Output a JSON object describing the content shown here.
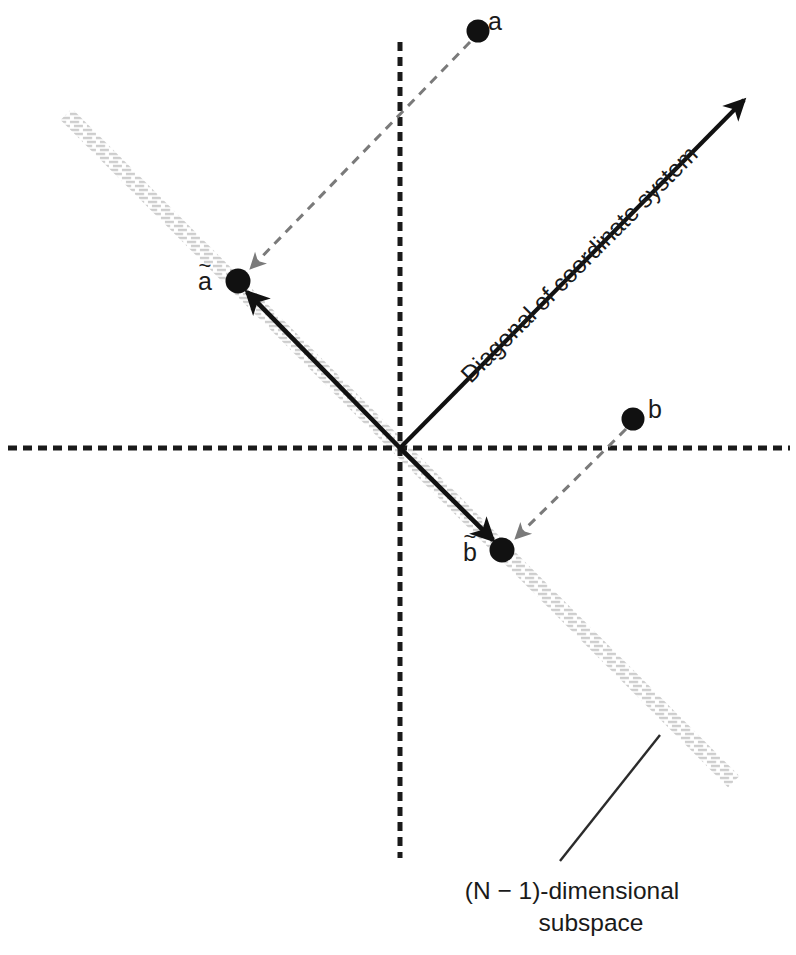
{
  "figure": {
    "width": 796,
    "height": 955,
    "background": "#ffffff",
    "origin": {
      "x": 400,
      "y": 448
    }
  },
  "colors": {
    "axis": "#1a1a1a",
    "point": "#111111",
    "vector": "#111111",
    "projection": "#7a7a7a",
    "subspace_hatch": "#b8b8b8",
    "text": "#1a1a1a",
    "leader": "#2b2b2b"
  },
  "axes": {
    "horizontal": {
      "name": "horizontal-axis",
      "x1": 8,
      "y1": 448,
      "x2": 790,
      "y2": 448,
      "style": "dashed",
      "dash": "9 6",
      "width": 5
    },
    "vertical": {
      "name": "vertical-axis",
      "x1": 400,
      "y1": 42,
      "x2": 400,
      "y2": 858,
      "style": "dashed",
      "dash": "9 6",
      "width": 5
    }
  },
  "subspace": {
    "label_line_1": "(N − 1)-dimensional",
    "label_line_2": "subspace",
    "hatch_band": {
      "x1": 68,
      "y1": 106,
      "x2": 732,
      "y2": 790,
      "angle_deg": -45
    },
    "leader": {
      "x1": 560,
      "y1": 862,
      "x2": 660,
      "y2": 735
    }
  },
  "diagonal": {
    "label": "Diagonal of coordinate system",
    "arrow": {
      "x1": 400,
      "y1": 448,
      "x2": 748,
      "y2": 96
    },
    "text_rotation_deg": -45
  },
  "points": [
    {
      "id": "a",
      "label": "a",
      "tilde": false,
      "x": 478,
      "y": 31,
      "radius": 11.5
    },
    {
      "id": "b",
      "label": "b",
      "tilde": false,
      "x": 633,
      "y": 419,
      "radius": 11.5
    },
    {
      "id": "a-tilde",
      "label": "a",
      "tilde": true,
      "x": 238,
      "y": 281,
      "radius": 12.5
    },
    {
      "id": "b-tilde",
      "label": "b",
      "tilde": true,
      "x": 502,
      "y": 550,
      "radius": 12.5
    }
  ],
  "vectors": [
    {
      "id": "vector-origin-to-a-tilde",
      "from": "origin",
      "to": "a-tilde",
      "x1": 400,
      "y1": 448,
      "x2": 243,
      "y2": 289,
      "style": "solid",
      "color": "#111111",
      "width": 4.5
    },
    {
      "id": "vector-origin-to-b-tilde",
      "from": "origin",
      "to": "b-tilde",
      "x1": 400,
      "y1": 448,
      "x2": 496,
      "y2": 543,
      "style": "solid",
      "color": "#111111",
      "width": 4.5
    }
  ],
  "projections": [
    {
      "id": "projection-a-to-a-tilde",
      "from": "a",
      "to": "a-tilde",
      "x1": 472,
      "y1": 40,
      "x2": 246,
      "y2": 273,
      "style": "dashed",
      "color": "#7a7a7a",
      "width": 3,
      "dash": "9 7"
    },
    {
      "id": "projection-b-to-b-tilde",
      "from": "b",
      "to": "b-tilde",
      "x1": 627,
      "y1": 428,
      "x2": 511,
      "y2": 542,
      "style": "dashed",
      "color": "#7a7a7a",
      "width": 3,
      "dash": "9 7"
    }
  ]
}
